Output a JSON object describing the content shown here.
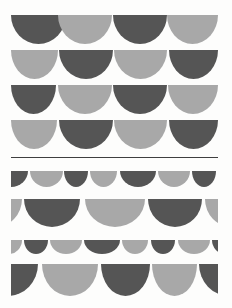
{
  "image": {
    "description": "Print of rows of scalloped semicircles (bunting pattern) in alternating dark and light gray watercolor tones, with a thin horizontal divider line separating a regular upper grid from an irregular lower section",
    "width": 232,
    "height": 308,
    "background": "#fdfdfc"
  },
  "colors": {
    "dark": "#555555",
    "light": "#a8a8a8"
  },
  "divider": {
    "x": 11,
    "y": 157,
    "width": 207,
    "color": "#3f3f3f"
  },
  "rows": [
    {
      "name": "row-1",
      "section": "top",
      "y": 15,
      "h": 29,
      "shapes": [
        {
          "x": 11,
          "w": 55,
          "tone": "dark"
        },
        {
          "x": 58,
          "w": 54,
          "tone": "light"
        },
        {
          "x": 113,
          "w": 54,
          "tone": "dark"
        },
        {
          "x": 167,
          "w": 51,
          "tone": "light"
        }
      ]
    },
    {
      "name": "row-2",
      "section": "top",
      "y": 50,
      "h": 29,
      "shapes": [
        {
          "x": 11,
          "w": 47,
          "tone": "light"
        },
        {
          "x": 59,
          "w": 54,
          "tone": "dark"
        },
        {
          "x": 114,
          "w": 53,
          "tone": "light"
        },
        {
          "x": 169,
          "w": 49,
          "tone": "dark"
        }
      ]
    },
    {
      "name": "row-3",
      "section": "top",
      "y": 85,
      "h": 29,
      "shapes": [
        {
          "x": 11,
          "w": 45,
          "tone": "dark"
        },
        {
          "x": 58,
          "w": 54,
          "tone": "light"
        },
        {
          "x": 113,
          "w": 54,
          "tone": "dark"
        },
        {
          "x": 168,
          "w": 50,
          "tone": "light"
        }
      ]
    },
    {
      "name": "row-4",
      "section": "top",
      "y": 120,
      "h": 29,
      "shapes": [
        {
          "x": 11,
          "w": 46,
          "tone": "light"
        },
        {
          "x": 59,
          "w": 54,
          "tone": "dark"
        },
        {
          "x": 114,
          "w": 53,
          "tone": "light"
        },
        {
          "x": 169,
          "w": 49,
          "tone": "dark"
        }
      ]
    },
    {
      "name": "row-5",
      "section": "bottom",
      "y": 171,
      "h": 16,
      "shapes": [
        {
          "x": 11,
          "w": 17,
          "tone": "dark"
        },
        {
          "x": 30,
          "w": 33,
          "tone": "light"
        },
        {
          "x": 64,
          "w": 24,
          "tone": "dark"
        },
        {
          "x": 90,
          "w": 27,
          "tone": "light"
        },
        {
          "x": 120,
          "w": 36,
          "tone": "dark"
        },
        {
          "x": 158,
          "w": 32,
          "tone": "light"
        },
        {
          "x": 192,
          "w": 24,
          "tone": "dark"
        }
      ]
    },
    {
      "name": "row-6",
      "section": "bottom",
      "y": 199,
      "h": 28,
      "shapes": [
        {
          "x": 11,
          "w": 11,
          "tone": "light"
        },
        {
          "x": 24,
          "w": 56,
          "tone": "dark"
        },
        {
          "x": 85,
          "w": 60,
          "tone": "light"
        },
        {
          "x": 148,
          "w": 54,
          "tone": "dark"
        },
        {
          "x": 205,
          "w": 13,
          "tone": "light"
        }
      ]
    },
    {
      "name": "row-7",
      "section": "bottom",
      "y": 240,
      "h": 14,
      "shapes": [
        {
          "x": 11,
          "w": 11,
          "tone": "light"
        },
        {
          "x": 24,
          "w": 24,
          "tone": "dark"
        },
        {
          "x": 50,
          "w": 32,
          "tone": "light"
        },
        {
          "x": 84,
          "w": 36,
          "tone": "dark"
        },
        {
          "x": 122,
          "w": 26,
          "tone": "light"
        },
        {
          "x": 151,
          "w": 24,
          "tone": "dark"
        },
        {
          "x": 178,
          "w": 32,
          "tone": "light"
        },
        {
          "x": 212,
          "w": 6,
          "tone": "dark"
        }
      ]
    },
    {
      "name": "row-8",
      "section": "bottom",
      "y": 264,
      "h": 32,
      "shapes": [
        {
          "x": 11,
          "w": 27,
          "tone": "dark"
        },
        {
          "x": 42,
          "w": 56,
          "tone": "light"
        },
        {
          "x": 101,
          "w": 49,
          "tone": "dark"
        },
        {
          "x": 152,
          "w": 45,
          "tone": "light"
        },
        {
          "x": 199,
          "w": 19,
          "tone": "dark"
        }
      ]
    }
  ],
  "partials": {
    "row-1-0": "full",
    "row-5-0": "clip-left",
    "row-6-0": "clip-left",
    "row-6-4": "clip-right",
    "row-7-0": "clip-left",
    "row-7-7": "clip-right",
    "row-8-0": "clip-left",
    "row-8-4": "clip-right",
    "row-2-3": "clip-right",
    "row-4-3": "clip-right",
    "row-1-3": "clip-right",
    "row-3-3": "clip-right",
    "row-2-0": "clip-left",
    "row-3-0": "clip-left",
    "row-4-0": "clip-left"
  }
}
